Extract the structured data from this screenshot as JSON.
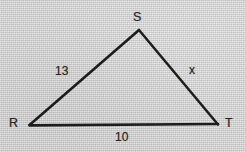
{
  "figure": {
    "background_color": "#cccccc",
    "stroke_color": "#1d1d1d",
    "text_color": "#232323"
  },
  "triangle": {
    "vertices": [
      {
        "name": "S",
        "label": "S",
        "x": 139,
        "y": 30
      },
      {
        "name": "R",
        "label": "R",
        "x": 29,
        "y": 125
      },
      {
        "name": "T",
        "label": "T",
        "x": 218,
        "y": 124
      }
    ],
    "sides": [
      {
        "name": "RS",
        "label": "13",
        "from": "R",
        "to": "S"
      },
      {
        "name": "ST",
        "label": "x",
        "from": "S",
        "to": "T"
      },
      {
        "name": "RT",
        "label": "10",
        "from": "R",
        "to": "T"
      }
    ]
  },
  "labels": {
    "vertex_S": "S",
    "vertex_R": "R",
    "vertex_T": "T",
    "side_RS": "13",
    "side_ST": "x",
    "side_RT": "10"
  }
}
